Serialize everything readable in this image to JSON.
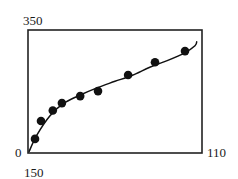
{
  "chart_data": {
    "type": "scatter",
    "title": "",
    "xlabel": "",
    "ylabel": "",
    "x_axis": {
      "min_label": "150",
      "max_label": "110",
      "range": [
        150,
        110
      ],
      "reversed": true
    },
    "y_axis": {
      "min_label": "0",
      "max_label": "350",
      "range": [
        0,
        350
      ]
    },
    "grid": false,
    "legend": null,
    "series": [
      {
        "name": "data points",
        "kind": "scatter",
        "marker": "filled-circle",
        "color": "#111111",
        "points": [
          {
            "x": 148.4,
            "y": 40
          },
          {
            "x": 147.0,
            "y": 91
          },
          {
            "x": 144.3,
            "y": 121
          },
          {
            "x": 142.2,
            "y": 142
          },
          {
            "x": 138.0,
            "y": 162
          },
          {
            "x": 133.9,
            "y": 176
          },
          {
            "x": 127.0,
            "y": 222
          },
          {
            "x": 120.8,
            "y": 258
          },
          {
            "x": 113.9,
            "y": 290
          }
        ]
      },
      {
        "name": "fit curve",
        "kind": "line",
        "color": "#111111",
        "points": [
          {
            "x": 149.8,
            "y": 3
          },
          {
            "x": 148.0,
            "y": 50
          },
          {
            "x": 145.0,
            "y": 105
          },
          {
            "x": 142.0,
            "y": 140
          },
          {
            "x": 138.0,
            "y": 165
          },
          {
            "x": 134.0,
            "y": 186
          },
          {
            "x": 130.0,
            "y": 204
          },
          {
            "x": 126.0,
            "y": 221
          },
          {
            "x": 122.0,
            "y": 244
          },
          {
            "x": 118.0,
            "y": 263
          },
          {
            "x": 114.0,
            "y": 285
          },
          {
            "x": 111.6,
            "y": 305
          },
          {
            "x": 111.2,
            "y": 318
          }
        ]
      }
    ]
  },
  "labels": {
    "y_top": "350",
    "y_bottom": "0",
    "x_left": "150",
    "x_right": "110"
  },
  "colors": {
    "ink": "#111111",
    "background": "#ffffff"
  }
}
